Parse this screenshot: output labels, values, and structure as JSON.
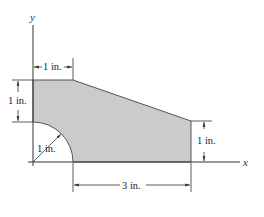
{
  "figure": {
    "type": "planar-area-diagram",
    "colors": {
      "fill": "#cbcbcb",
      "outline": "#555555",
      "line": "#333333"
    },
    "axes": {
      "x_label": "x",
      "y_label": "y"
    },
    "dimensions": {
      "top_width": "1 in.",
      "left_height": "1 in.",
      "fillet_radius": "1 in.",
      "bottom_width": "3 in.",
      "right_height": "1 in."
    }
  }
}
